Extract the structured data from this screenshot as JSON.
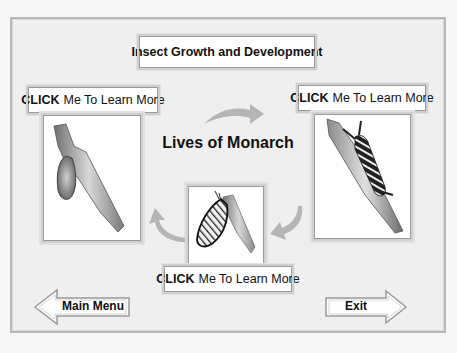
{
  "header": {
    "title": "Insect Growth and Development"
  },
  "main": {
    "title": "Lives of Monarch"
  },
  "stages": [
    {
      "id": "chrysalis",
      "button_bold": "CLICK",
      "button_rest": "Me To Learn More",
      "image_icon": "chrysalis-on-branch-icon"
    },
    {
      "id": "caterpillar",
      "button_bold": "CLICK",
      "button_rest": "Me To Learn More",
      "image_icon": "caterpillar-on-branch-icon"
    },
    {
      "id": "butterfly",
      "button_bold": "CLICK",
      "button_rest": "Me To Learn More",
      "image_icon": "butterfly-on-branch-icon"
    }
  ],
  "cycle_arrows": [
    "curved-arrow-right-icon",
    "curved-arrow-down-left-icon",
    "curved-arrow-up-left-icon"
  ],
  "nav": {
    "main_menu_label": "Main Menu",
    "exit_label": "Exit"
  },
  "colors": {
    "background": "#efefef",
    "box_border": "#9a9a9a",
    "arrow_gray": "#b5b5b5",
    "text": "#111111"
  }
}
